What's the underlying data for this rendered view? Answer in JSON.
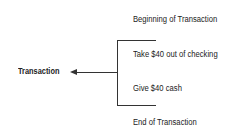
{
  "diagram": {
    "root_label": "Transaction",
    "steps": [
      "Beginning of Transaction",
      "Take $40 out of checking",
      "Give $40 cash",
      "End of Transaction"
    ]
  }
}
